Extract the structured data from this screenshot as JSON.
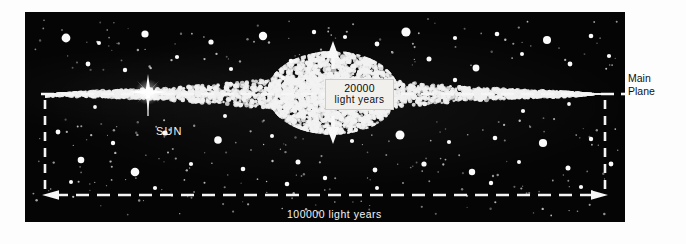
{
  "figure": {
    "background_color": "#050505",
    "page_color": "#ffffff",
    "star_color": "#f4f4f4"
  },
  "labels": {
    "scale_vertical_value": "20000",
    "scale_vertical_unit": "light years",
    "scale_horizontal": "100000 light years",
    "sun": "SUN",
    "main_plane_line1": "Main",
    "main_plane_line2": "Plane"
  },
  "chart_data": {
    "type": "scatter",
    "title": "",
    "annotations": [
      {
        "text": "20000 light years",
        "kind": "vertical-extent",
        "x": 333,
        "y": 93
      },
      {
        "text": "100000 light years",
        "kind": "horizontal-extent",
        "x": 333,
        "y": 195
      },
      {
        "text": "SUN",
        "kind": "point-callout",
        "x": 148,
        "y": 92
      },
      {
        "text": "Main Plane",
        "kind": "axis-callout",
        "x": 630,
        "y": 80
      }
    ],
    "measurements": [
      {
        "name": "galactic diameter",
        "value": 100000,
        "unit": "light years"
      },
      {
        "name": "central bulge thickness",
        "value": 20000,
        "unit": "light years"
      }
    ]
  }
}
